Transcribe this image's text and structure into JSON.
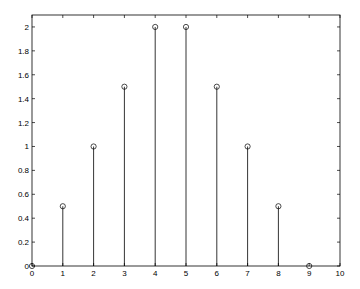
{
  "chart_data": {
    "type": "stem",
    "title": "",
    "xlabel": "",
    "ylabel": "",
    "x": [
      0,
      1,
      2,
      3,
      4,
      5,
      6,
      7,
      8,
      9
    ],
    "values": [
      0,
      0.5,
      1,
      1.5,
      2,
      2,
      1.5,
      1,
      0.5,
      0
    ],
    "xlim": [
      0,
      10
    ],
    "ylim": [
      0,
      2.1
    ],
    "xticks": [
      "0",
      "1",
      "2",
      "3",
      "4",
      "5",
      "6",
      "7",
      "8",
      "9",
      "10"
    ],
    "yticks": [
      "0",
      "0.2",
      "0.4",
      "0.6",
      "0.8",
      "1",
      "1.2",
      "1.4",
      "1.6",
      "1.8",
      "2"
    ],
    "grid": false,
    "legend": null,
    "marker": "circle-open",
    "colors": {
      "stem": "#000000",
      "axis": "#000000",
      "background": "#ffffff"
    }
  }
}
